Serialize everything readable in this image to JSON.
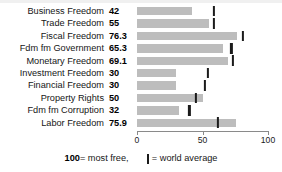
{
  "chart_data": {
    "type": "bar",
    "title": "",
    "subtitle": "",
    "xlabel": "",
    "ylabel": "",
    "orientation": "horizontal",
    "xlim": [
      0,
      100
    ],
    "grid": false,
    "axis_ticks": [
      {
        "value": 0,
        "label": "0"
      },
      {
        "value": 50,
        "label": "50"
      },
      {
        "value": 100,
        "label": "100"
      }
    ],
    "categories": [
      "Business Freedom",
      "Trade Freedom",
      "Fiscal Freedom",
      "Fdm fm Government",
      "Monetary Freedom",
      "Investment Freedom",
      "Financial Freedom",
      "Property Rights",
      "Fdm fm Corruption",
      "Labor Freedom"
    ],
    "values": [
      42,
      55,
      76.3,
      65.3,
      69.1,
      30,
      30,
      50,
      32,
      75.9
    ],
    "value_labels": [
      "42",
      "55",
      "76.3",
      "65.3",
      "69.1",
      "30",
      "30",
      "50",
      "32",
      "75.9"
    ],
    "series": [
      {
        "name": "Score",
        "values": [
          42,
          55,
          76.3,
          65.3,
          69.1,
          30,
          30,
          50,
          32,
          75.9
        ]
      },
      {
        "name": "World average",
        "marker": "tick",
        "values": [
          59,
          59,
          81,
          72,
          73,
          54,
          52,
          45,
          40,
          62
        ]
      }
    ],
    "colors": {
      "bar": "#bdbdbd",
      "marker": "#1b1b1b",
      "axis": "#8a8a8a",
      "text": "#161616",
      "background": "#ffffff"
    },
    "legend_position": "bottom",
    "annotations": [
      "100 = most free,",
      "= world average"
    ]
  },
  "rows": [
    {
      "label": "Business Freedom",
      "value_label": "42",
      "value": 42,
      "average": 59
    },
    {
      "label": "Trade Freedom",
      "value_label": "55",
      "value": 55,
      "average": 59
    },
    {
      "label": "Fiscal Freedom",
      "value_label": "76.3",
      "value": 76.3,
      "average": 81
    },
    {
      "label": "Fdm fm Government",
      "value_label": "65.3",
      "value": 65.3,
      "average": 72
    },
    {
      "label": "Monetary Freedom",
      "value_label": "69.1",
      "value": 69.1,
      "average": 73
    },
    {
      "label": "Investment Freedom",
      "value_label": "30",
      "value": 30,
      "average": 54
    },
    {
      "label": "Financial Freedom",
      "value_label": "30",
      "value": 30,
      "average": 52
    },
    {
      "label": "Property Rights",
      "value_label": "50",
      "value": 50,
      "average": 45
    },
    {
      "label": "Fdm fm Corruption",
      "value_label": "32",
      "value": 32,
      "average": 40
    },
    {
      "label": "Labor Freedom",
      "value_label": "75.9",
      "value": 75.9,
      "average": 62
    }
  ],
  "axis": {
    "ticks": [
      {
        "label": "0",
        "value": 0
      },
      {
        "label": "50",
        "value": 50
      },
      {
        "label": "100",
        "value": 100
      }
    ]
  },
  "legend": {
    "most_free_number": "100",
    "most_free_text": " = most free,",
    "average_text": " = world average"
  }
}
